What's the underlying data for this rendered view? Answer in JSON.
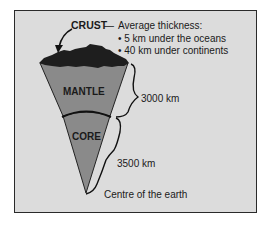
{
  "diagram": {
    "layers": [
      {
        "name": "CRUST",
        "color": "#1e1e1e"
      },
      {
        "name": "MANTLE",
        "color": "#8c8c8c"
      },
      {
        "name": "CORE",
        "color": "#8c8c8c"
      }
    ],
    "crust_callout": {
      "label": "CRUST",
      "dash": "—",
      "heading": "Average thickness:",
      "bullets": [
        "5 km under the oceans",
        "40 km under continents"
      ]
    },
    "mantle_thickness": "3000 km",
    "core_thickness": "3500 km",
    "centre_label": "Centre of the earth",
    "colors": {
      "background": "#dcdcdc",
      "frame": "#2a2a2a",
      "crust": "#1e1e1e",
      "mantle": "#8c8c8c",
      "core": "#8c8c8c"
    }
  }
}
